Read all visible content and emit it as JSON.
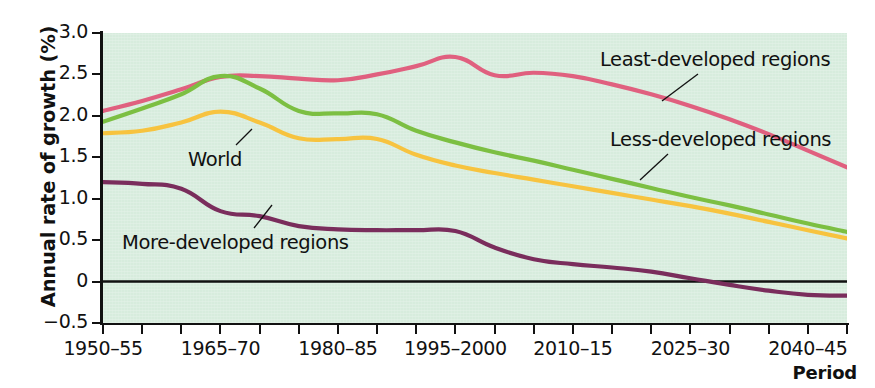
{
  "chart_data": {
    "type": "line",
    "title": "",
    "xlabel": "Period",
    "ylabel": "Annual rate of growth (%)",
    "ylim": [
      -0.5,
      3.0
    ],
    "yticks": [
      -0.5,
      0,
      0.5,
      1.0,
      1.5,
      2.0,
      2.5,
      3.0
    ],
    "ytick_labels": [
      "−0.5",
      "0",
      "0.5",
      "1.0",
      "1.5",
      "2.0",
      "2.5",
      "3.0"
    ],
    "grid": false,
    "legend_position": "inline-annotations",
    "zero_line": true,
    "background_color": "#d7ecdd",
    "categories": [
      "1950–55",
      "1955–60",
      "1960–65",
      "1965–70",
      "1970–75",
      "1975–80",
      "1980–85",
      "1985–90",
      "1990–95",
      "1995–2000",
      "2000–05",
      "2005–10",
      "2010–15",
      "2015–20",
      "2020–25",
      "2025–30",
      "2030–35",
      "2035–40",
      "2040–45",
      "2045–50"
    ],
    "xtick_labels_shown": [
      {
        "index": 0,
        "label": "1950–55"
      },
      {
        "index": 3,
        "label": "1965–70"
      },
      {
        "index": 6,
        "label": "1980–85"
      },
      {
        "index": 9,
        "label": "1995–2000"
      },
      {
        "index": 12,
        "label": "2010–15"
      },
      {
        "index": 15,
        "label": "2025–30"
      },
      {
        "index": 18,
        "label": "2040–45"
      }
    ],
    "series": [
      {
        "name": "Least-developed regions",
        "color": "#e0607f",
        "values": [
          2.06,
          2.18,
          2.32,
          2.47,
          2.48,
          2.45,
          2.43,
          2.5,
          2.6,
          2.71,
          2.49,
          2.52,
          2.48,
          2.38,
          2.26,
          2.12,
          1.96,
          1.78,
          1.58,
          1.38
        ]
      },
      {
        "name": "Less-developed regions",
        "color": "#7cbf42",
        "values": [
          1.93,
          2.09,
          2.26,
          2.48,
          2.33,
          2.06,
          2.03,
          2.02,
          1.82,
          1.68,
          1.56,
          1.46,
          1.35,
          1.24,
          1.13,
          1.02,
          0.92,
          0.81,
          0.7,
          0.6
        ]
      },
      {
        "name": "World",
        "color": "#f7c33f",
        "values": [
          1.79,
          1.82,
          1.92,
          2.05,
          1.92,
          1.73,
          1.72,
          1.72,
          1.53,
          1.4,
          1.31,
          1.23,
          1.15,
          1.07,
          0.99,
          0.91,
          0.82,
          0.72,
          0.62,
          0.52
        ]
      },
      {
        "name": "More-developed regions",
        "color": "#7a2d5c",
        "values": [
          1.2,
          1.18,
          1.12,
          0.85,
          0.79,
          0.67,
          0.63,
          0.62,
          0.62,
          0.61,
          0.41,
          0.27,
          0.21,
          0.17,
          0.12,
          0.04,
          -0.04,
          -0.11,
          -0.16,
          -0.17
        ]
      }
    ],
    "annotations": [
      {
        "text": "Least-developed regions",
        "series": "Least-developed regions"
      },
      {
        "text": "Less-developed regions",
        "series": "Less-developed regions"
      },
      {
        "text": "World",
        "series": "World"
      },
      {
        "text": "More-developed regions",
        "series": "More-developed regions"
      }
    ]
  }
}
